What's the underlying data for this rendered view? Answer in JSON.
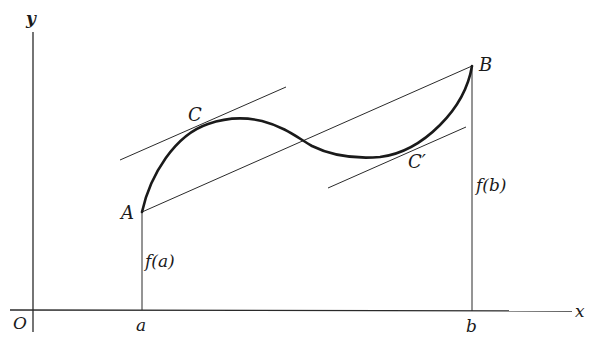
{
  "figure": {
    "colors": {
      "ink": "#1a1a1a",
      "background": "#ffffff"
    },
    "axes": {
      "x_label": "x",
      "y_label": "y",
      "origin_label": "O"
    },
    "ticks": {
      "a": "a",
      "b": "b"
    },
    "points": {
      "A": "A",
      "B": "B",
      "C": "C",
      "C_prime": "C′"
    },
    "segments": {
      "fa": "f(a)",
      "fb": "f(b)"
    }
  }
}
